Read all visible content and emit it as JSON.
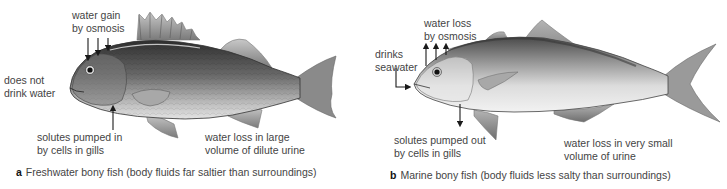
{
  "panels": [
    {
      "id": "a",
      "title": "Freshwater bony fish",
      "caption_letter": "a",
      "caption_text": "Freshwater bony fish (body fluids far saltier than surroundings)",
      "labels": {
        "water": "water gain",
        "water2": "by osmosis",
        "drink1": "does not",
        "drink2": "drink water",
        "solutes1": "solutes pumped in",
        "solutes2": "by cells in gills",
        "urine1": "water loss in large",
        "urine2": "volume of dilute urine"
      },
      "arrow_direction_osmosis": "inward",
      "arrow_direction_gills": "inward"
    },
    {
      "id": "b",
      "title": "Marine bony fish",
      "caption_letter": "b",
      "caption_text": "Marine bony fish (body fluids less salty than surroundings)",
      "labels": {
        "water": "water loss",
        "water2": "by osmosis",
        "drink1": "drinks",
        "drink2": "seawater",
        "solutes1": "solutes pumped out",
        "solutes2": "by cells in gills",
        "urine1": "water loss in very small",
        "urine2": "volume of urine"
      },
      "arrow_direction_osmosis": "outward",
      "arrow_direction_gills": "outward"
    }
  ],
  "colors": {
    "text": "#444444",
    "arrow": "#1a1a1a",
    "freshwater_body_dark": "#3c3c3c",
    "freshwater_body_light": "#d8d8d8",
    "marine_body_dark": "#5a5a5a",
    "marine_body_light": "#ececec"
  }
}
